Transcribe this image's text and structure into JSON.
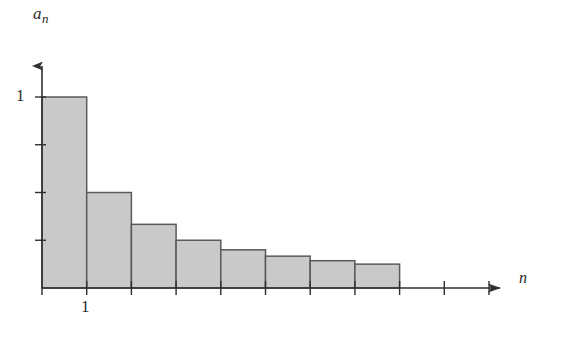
{
  "figure": {
    "background": "#ffffff",
    "ink_color": "#3a3a3a",
    "bar_fill": "#c9c9c9",
    "bar_stroke": "#5a5a5a"
  },
  "labels": {
    "y_axis": "a",
    "y_axis_subscript": "n",
    "x_axis": "n",
    "y_tick_1": "1",
    "x_tick_1": "1"
  },
  "chart_data": {
    "type": "bar",
    "title": "",
    "xlabel": "n",
    "ylabel": "a_n",
    "categories": [
      "1",
      "2",
      "3",
      "4",
      "5",
      "6",
      "7",
      "8"
    ],
    "values": [
      1,
      0.5,
      0.3333,
      0.25,
      0.2,
      0.1667,
      0.1429,
      0.125
    ],
    "value_labels": [
      "1",
      "1/2",
      "1/3",
      "1/4",
      "1/5",
      "1/6",
      "1/7",
      "1/8"
    ],
    "xlim": [
      0,
      10.5
    ],
    "ylim": [
      0,
      1.2
    ],
    "x_tick_labels": [
      "1"
    ],
    "y_tick_labels": [
      "1"
    ],
    "x_tick_values": [
      1
    ],
    "y_tick_values": [
      0.25,
      0.5,
      0.75,
      1
    ],
    "grid": false,
    "legend": null,
    "annotations": [],
    "series_name": "harmonic sequence a_n = 1/n",
    "bar_width_ratio": 1.0,
    "x_axis_arrow": true,
    "y_axis_arrow": true
  },
  "geometry": {
    "origin_x": 42,
    "baseline_y": 288,
    "unit_x": 44.7,
    "unit_y": 191,
    "y_axis_top": 55,
    "x_axis_right": 508,
    "n_x_ticks": 10,
    "n_y_ticks": 4
  }
}
